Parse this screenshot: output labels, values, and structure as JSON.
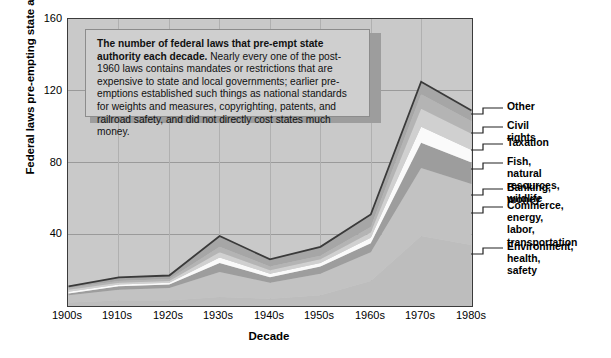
{
  "axes": {
    "ylabel": "Federal laws pre-empting state authority",
    "xlabel": "Decade",
    "yticks": [
      "160",
      "120",
      "80",
      "40"
    ],
    "xticks": [
      "1900s",
      "1910s",
      "1920s",
      "1930s",
      "1940s",
      "1950s",
      "1960s",
      "1970s",
      "1980s"
    ]
  },
  "callout": {
    "lead": "The number of federal laws that pre-empt state authority each decade.",
    "body": " Nearly every one of the post-1960 laws contains mandates or restrictions that are expensive to state and local governments; earlier pre-emptions established such things as national standards for weights and measures, copyrighting, patents, and railroad safety, and did not directly cost states much money."
  },
  "legend": [
    {
      "label": "Other",
      "y": 108
    },
    {
      "label": "Civil rights",
      "y": 127
    },
    {
      "label": "Taxation",
      "y": 144
    },
    {
      "label": "Fish, natural\nresources, wildlife",
      "y": 163
    },
    {
      "label": "Banking, money",
      "y": 189
    },
    {
      "label": "Commerce, energy,\nlabor, transportation",
      "y": 207
    },
    {
      "label": "Environment, health,\nsafety",
      "y": 248
    }
  ],
  "colors": {
    "plot_background": "#c9c9c9",
    "frame": "#3b3b3b",
    "gridline": "#9a9a9a",
    "series": [
      "#bdbdbd",
      "#c2c2c2",
      "#9d9d9d",
      "#fafafa",
      "#d0d0d0",
      "#b4b4b4",
      "#a6a6a6"
    ]
  },
  "chart_data": {
    "type": "area",
    "title": "",
    "xlabel": "Decade",
    "ylabel": "Federal laws pre-empting state authority",
    "categories": [
      "1900s",
      "1910s",
      "1920s",
      "1930s",
      "1940s",
      "1950s",
      "1960s",
      "1970s",
      "1980s"
    ],
    "ylim": [
      0,
      160
    ],
    "xlim": [
      "1900s",
      "1980s"
    ],
    "grid": true,
    "legend_position": "right",
    "stacked": true,
    "series": [
      {
        "name": "Environment, health, safety",
        "values": [
          2,
          3,
          3,
          5,
          4,
          6,
          14,
          39,
          34
        ]
      },
      {
        "name": "Commerce, energy, labor, transportation",
        "values": [
          4,
          6,
          7,
          14,
          9,
          12,
          16,
          38,
          34
        ]
      },
      {
        "name": "Banking, money",
        "values": [
          1,
          2,
          2,
          5,
          3,
          4,
          5,
          14,
          12
        ]
      },
      {
        "name": "Taxation",
        "values": [
          1,
          1,
          1,
          3,
          2,
          2,
          3,
          9,
          7
        ]
      },
      {
        "name": "Fish, natural resources, wildlife",
        "values": [
          1,
          1,
          1,
          3,
          2,
          2,
          3,
          10,
          9
        ]
      },
      {
        "name": "Civil rights",
        "values": [
          1,
          1,
          1,
          3,
          2,
          2,
          3,
          8,
          7
        ]
      },
      {
        "name": "Other",
        "values": [
          1,
          2,
          2,
          6,
          4,
          5,
          7,
          7,
          6
        ]
      }
    ],
    "totals": [
      11,
      16,
      17,
      39,
      26,
      33,
      51,
      125,
      109
    ]
  }
}
